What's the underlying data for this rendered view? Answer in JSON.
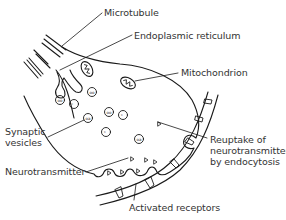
{
  "diagram": {
    "colors": {
      "stroke": "#1a1a1a",
      "text": "#333333",
      "background": "#ffffff"
    },
    "labels": {
      "microtubule": "Microtubule",
      "endoplasmic_reticulum": "Endoplasmic reticulum",
      "mitochondrion": "Mitochondrion",
      "synaptic_vesicles": [
        "Synaptic",
        "vesicles"
      ],
      "reuptake": [
        "Reuptake of",
        "neurotransmitter",
        "by endocytosis"
      ],
      "neurotransmitter": "Neurotransmitter",
      "activated_receptors": "Activated receptors"
    }
  }
}
